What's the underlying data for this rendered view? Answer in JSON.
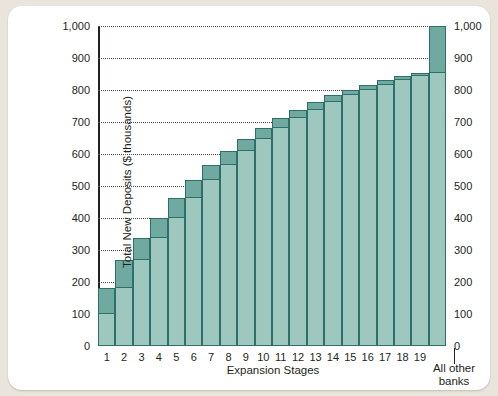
{
  "chart_data": {
    "type": "bar",
    "title": "",
    "xlabel": "Expansion Stages",
    "ylabel": "Total New Deposits ($ thousands)",
    "ylim": [
      0,
      1000
    ],
    "ytick_values": [
      0,
      100,
      200,
      300,
      400,
      500,
      600,
      700,
      800,
      900,
      1000
    ],
    "ytick_labels": [
      "0",
      "100",
      "200",
      "300",
      "400",
      "500",
      "600",
      "700",
      "800",
      "900",
      "1,000"
    ],
    "grid": true,
    "legend": "none",
    "axis_left_labels": [
      "1,000",
      "900",
      "800",
      "700",
      "600",
      "500",
      "400",
      "300",
      "200",
      "100",
      "0"
    ],
    "axis_right_labels": [
      "1,000",
      "900",
      "800",
      "700",
      "600",
      "500",
      "400",
      "300",
      "200",
      "100",
      "0"
    ],
    "categories": [
      "1",
      "2",
      "3",
      "4",
      "5",
      "6",
      "7",
      "8",
      "9",
      "10",
      "11",
      "12",
      "13",
      "14",
      "15",
      "16",
      "17",
      "18",
      "19",
      "All other banks"
    ],
    "last_category_label_line1": "All other",
    "last_category_label_line2": "banks",
    "series": [
      {
        "name": "Cumulative total new deposits",
        "values": [
          180,
          268,
          337,
          401,
          464,
          518,
          567,
          608,
          647,
          682,
          711,
          738,
          762,
          783,
          801,
          817,
          831,
          843,
          853,
          1000
        ]
      },
      {
        "name": "Base (previous stage cumulative)",
        "values": [
          100,
          180,
          268,
          337,
          401,
          464,
          518,
          567,
          608,
          647,
          682,
          711,
          738,
          762,
          783,
          801,
          817,
          831,
          843,
          853
        ]
      },
      {
        "name": "New deposit increment at this stage",
        "values": [
          80,
          88,
          69,
          64,
          63,
          54,
          49,
          41,
          39,
          35,
          29,
          27,
          24,
          21,
          18,
          16,
          14,
          12,
          10,
          147
        ]
      }
    ],
    "colors": {
      "bar_base": "#9ec8bd",
      "bar_increment": "#6fa9a0",
      "bar_outline": "#2f6f6a",
      "axis": "#231f20",
      "gridline": "#4a4a4a",
      "card_background": "#ffffff",
      "page_background": "#e9e5dc"
    }
  }
}
